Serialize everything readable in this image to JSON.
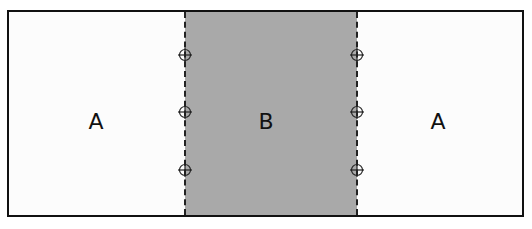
{
  "diagram": {
    "regions": [
      {
        "id": "left",
        "label": "A",
        "fill": "#fcfcfc"
      },
      {
        "id": "middle",
        "label": "B",
        "fill": "#a9a9a9"
      },
      {
        "id": "right",
        "label": "A",
        "fill": "#fcfcfc"
      }
    ],
    "dividers": [
      {
        "position": "left",
        "style": "dashed",
        "markers": 3
      },
      {
        "position": "right",
        "style": "dashed",
        "markers": 3
      }
    ],
    "marker_icon": "crosshair-circle-icon",
    "border_color": "#111111"
  }
}
